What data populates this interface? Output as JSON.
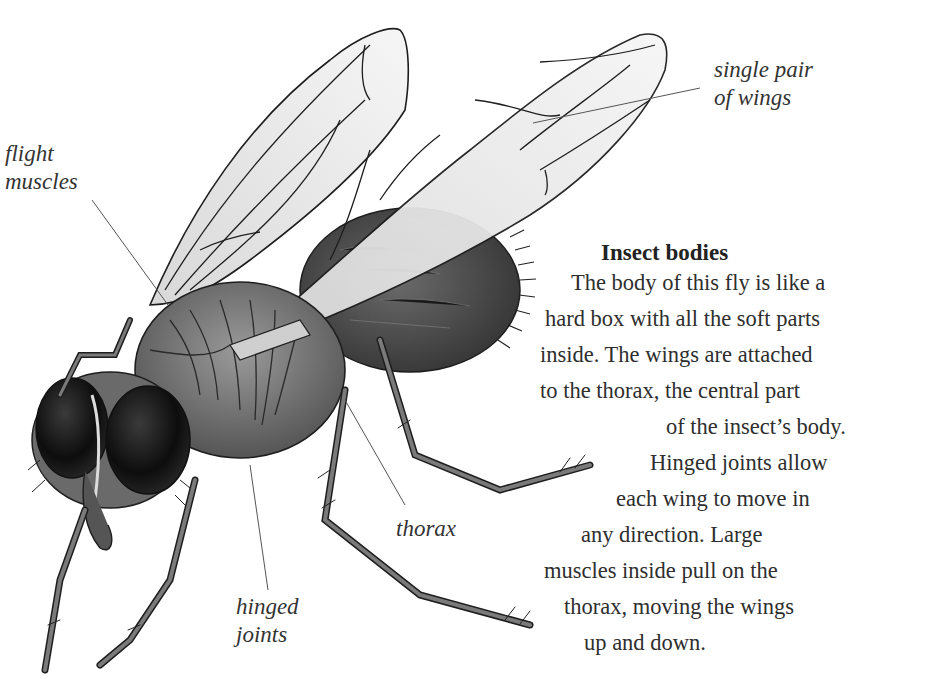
{
  "illustration": {
    "subject": "housefly",
    "style": "grayscale pen-and-ink with wash"
  },
  "labels": {
    "wings": "single pair\nof wings",
    "flight_muscles": "flight\nmuscles",
    "hinged_joints": "hinged\njoints",
    "thorax": "thorax"
  },
  "article": {
    "heading": "Insect bodies",
    "lines": [
      "The body of this fly is like a",
      "hard box with all the soft parts",
      "inside. The wings are attached",
      "to the thorax, the central part",
      "of the insect’s body.",
      "Hinged joints allow",
      "each wing to move in",
      "any direction. Large",
      "muscles inside pull on the",
      "thorax, moving the wings",
      "up and down."
    ]
  },
  "colors": {
    "background": "#ffffff",
    "text": "#2a2a2a",
    "ink": "#1e1e1e",
    "body_dark": "#4a4a4a",
    "body_mid": "#7a7a7a",
    "wing_fill": "#ececec",
    "leader_line": "#555555"
  }
}
